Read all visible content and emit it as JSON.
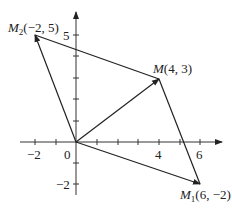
{
  "diagram": {
    "type": "coordinate-vector-diagram",
    "origin_label": "0",
    "x_axis": {
      "ticks": [
        -2,
        -1,
        1,
        2,
        3,
        4,
        5,
        6
      ],
      "labeled_ticks": [
        "-2",
        "4",
        "6"
      ]
    },
    "y_axis": {
      "ticks": [
        -2,
        -1,
        1,
        2,
        3,
        4,
        5
      ],
      "labeled_ticks": [
        "5",
        "-2"
      ]
    },
    "points": [
      {
        "id": "M",
        "name": "M",
        "subscript": "",
        "coords": "(4, 3)",
        "x": 4,
        "y": 3
      },
      {
        "id": "M1",
        "name": "M",
        "subscript": "1",
        "coords": "(6, −2)",
        "x": 6,
        "y": -2
      },
      {
        "id": "M2",
        "name": "M",
        "subscript": "2",
        "coords": "(−2, 5)",
        "x": -2,
        "y": 5
      }
    ],
    "vectors": [
      {
        "from": "O",
        "to": "M"
      },
      {
        "from": "O",
        "to": "M1"
      },
      {
        "from": "O",
        "to": "M2"
      }
    ],
    "segments": [
      {
        "from": "M2",
        "to": "M"
      },
      {
        "from": "M",
        "to": "M1"
      }
    ],
    "tick_labels": {
      "x_neg2": "−2",
      "x_4": "4",
      "x_6": "6",
      "y_5": "5",
      "y_neg2": "−2"
    },
    "labels": {
      "M_name": "M",
      "M_coords": "(4, 3)",
      "M1_name": "M",
      "M1_sub": "1",
      "M1_coords": "(6, −2)",
      "M2_name": "M",
      "M2_sub": "2",
      "M2_coords": "(−2, 5)"
    },
    "colors": {
      "line": "#222222",
      "background": "#ffffff"
    }
  }
}
